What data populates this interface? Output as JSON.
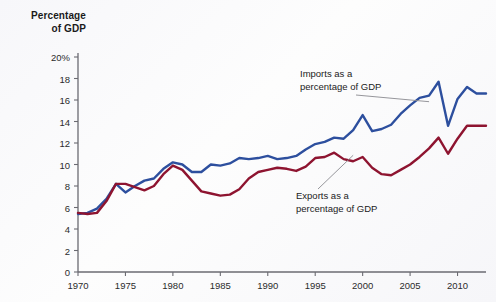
{
  "chart_data": {
    "type": "line",
    "title": "Percentage of GDP",
    "title_line1": "Percentage",
    "title_line2": "of GDP",
    "xlabel": "",
    "ylabel": "Percentage of GDP",
    "xlim": [
      1970,
      2013
    ],
    "ylim": [
      0,
      20
    ],
    "grid": false,
    "legend_position": "inline-annotations",
    "ytick_labels": [
      "0",
      "2",
      "4",
      "6",
      "8",
      "10",
      "12",
      "14",
      "16",
      "18",
      "20%"
    ],
    "ytick_values": [
      0,
      2,
      4,
      6,
      8,
      10,
      12,
      14,
      16,
      18,
      20
    ],
    "xtick_labels": [
      "1970",
      "1975",
      "1980",
      "1985",
      "1990",
      "1995",
      "2000",
      "2005",
      "2010"
    ],
    "xtick_values": [
      1970,
      1975,
      1980,
      1985,
      1990,
      1995,
      2000,
      2005,
      2010
    ],
    "x": [
      1970,
      1971,
      1972,
      1973,
      1974,
      1975,
      1976,
      1977,
      1978,
      1979,
      1980,
      1981,
      1982,
      1983,
      1984,
      1985,
      1986,
      1987,
      1988,
      1989,
      1990,
      1991,
      1992,
      1993,
      1994,
      1995,
      1996,
      1997,
      1998,
      1999,
      2000,
      2001,
      2002,
      2003,
      2004,
      2005,
      2006,
      2007,
      2008,
      2009,
      2010,
      2011,
      2012,
      2013
    ],
    "series": [
      {
        "name": "Imports as a percentage of GDP",
        "color": "#2d4f9e",
        "values": [
          5.4,
          5.5,
          5.9,
          6.8,
          8.2,
          7.4,
          8.0,
          8.5,
          8.7,
          9.6,
          10.2,
          10.0,
          9.3,
          9.3,
          10.0,
          9.9,
          10.1,
          10.6,
          10.5,
          10.6,
          10.8,
          10.5,
          10.6,
          10.8,
          11.4,
          11.9,
          12.1,
          12.5,
          12.4,
          13.2,
          14.6,
          13.1,
          13.3,
          13.7,
          14.7,
          15.5,
          16.2,
          16.4,
          17.7,
          13.6,
          16.1,
          17.2,
          16.6,
          16.6
        ]
      },
      {
        "name": "Exports as a percentage of GDP",
        "color": "#8e1430",
        "values": [
          5.5,
          5.4,
          5.5,
          6.6,
          8.2,
          8.2,
          7.9,
          7.6,
          8.0,
          9.1,
          9.9,
          9.5,
          8.5,
          7.5,
          7.3,
          7.1,
          7.2,
          7.7,
          8.7,
          9.3,
          9.5,
          9.7,
          9.6,
          9.4,
          9.8,
          10.6,
          10.7,
          11.1,
          10.5,
          10.3,
          10.7,
          9.7,
          9.1,
          9.0,
          9.5,
          10.0,
          10.7,
          11.5,
          12.5,
          11.0,
          12.4,
          13.6,
          13.6,
          13.6
        ]
      }
    ],
    "annotations": [
      {
        "id": "imports-annotation",
        "line1": "Imports as a",
        "line2": "percentage of GDP",
        "target_x": 2007,
        "target_y": 16.4
      },
      {
        "id": "exports-annotation",
        "line1": "Exports as a",
        "line2": "percentage of GDP",
        "target_x": 1999,
        "target_y": 10.3
      }
    ]
  }
}
